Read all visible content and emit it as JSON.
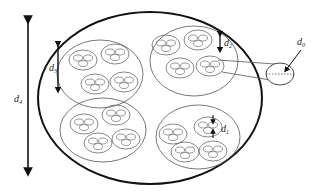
{
  "diagram": {
    "labels": {
      "d4": {
        "main": "d",
        "sub": "4"
      },
      "d3": {
        "main": "d",
        "sub": "3"
      },
      "d2": {
        "main": "d",
        "sub": "2"
      },
      "d1": {
        "main": "d",
        "sub": "1"
      },
      "d0": {
        "main": "d",
        "sub": "0"
      }
    },
    "colors": {
      "outer_stroke": "#111111",
      "inner_stroke": "#555555",
      "arrow": "#111111",
      "background": "#ffffff"
    },
    "clusters": [
      {
        "id": "top-left",
        "cx": 100,
        "cy": 74,
        "rx": 43,
        "ry": 34
      },
      {
        "id": "top-right",
        "cx": 194,
        "cy": 61,
        "rx": 44,
        "ry": 35
      },
      {
        "id": "bottom-left",
        "cx": 103,
        "cy": 130,
        "rx": 43,
        "ry": 32
      },
      {
        "id": "bottom-right",
        "cx": 198,
        "cy": 137,
        "rx": 42,
        "ry": 32
      }
    ]
  }
}
